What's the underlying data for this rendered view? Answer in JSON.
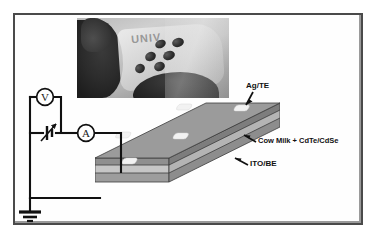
{
  "figure": {
    "kind": "device-schematic",
    "background_color": "#ffffff",
    "frame_color": "#4a4a4a"
  },
  "inset_photo": {
    "name": "device-photograph",
    "overlay_text": "UNIV",
    "description_colors": {
      "substrate": "#d6d6d6",
      "hand": "#2b2b2b",
      "electrode_dot": "#2e2e2e"
    },
    "electrode_dots": [
      {
        "x": 78,
        "y": 22,
        "w": 11,
        "h": 8,
        "rot": -24
      },
      {
        "x": 95,
        "y": 20,
        "w": 12,
        "h": 9,
        "rot": -18
      },
      {
        "x": 68,
        "y": 34,
        "w": 11,
        "h": 9,
        "rot": -26
      },
      {
        "x": 86,
        "y": 33,
        "w": 12,
        "h": 9,
        "rot": -20
      },
      {
        "x": 58,
        "y": 46,
        "w": 10,
        "h": 9,
        "rot": -30
      },
      {
        "x": 77,
        "y": 44,
        "w": 11,
        "h": 9,
        "rot": -22
      }
    ]
  },
  "device": {
    "name": "thin-film-device-slab",
    "top_face_color": "#9e9e9e",
    "milk_layer_color": "#8a8a8a",
    "ito_layer_color": "#bdbdbd",
    "base_layer_color": "#a8a8a8",
    "electrode_pad_color": "#f2f2f2",
    "electrode_pads": [
      {
        "x": 88,
        "y": 8
      },
      {
        "x": 146,
        "y": 9
      },
      {
        "x": 42,
        "y": 36
      },
      {
        "x": 100,
        "y": 37
      },
      {
        "x": 4,
        "y": 62
      },
      {
        "x": 62,
        "y": 62
      }
    ]
  },
  "labels": {
    "top_electrode": "Ag/TE",
    "active_layer": "Cow Milk + CdTe/CdSe",
    "bottom_electrode": "ITO/BE"
  },
  "circuit": {
    "voltmeter_label": "V",
    "ammeter_label": "A",
    "source_name": "variable-voltage-source",
    "ground_name": "earth-ground",
    "wire_color": "#111111"
  }
}
